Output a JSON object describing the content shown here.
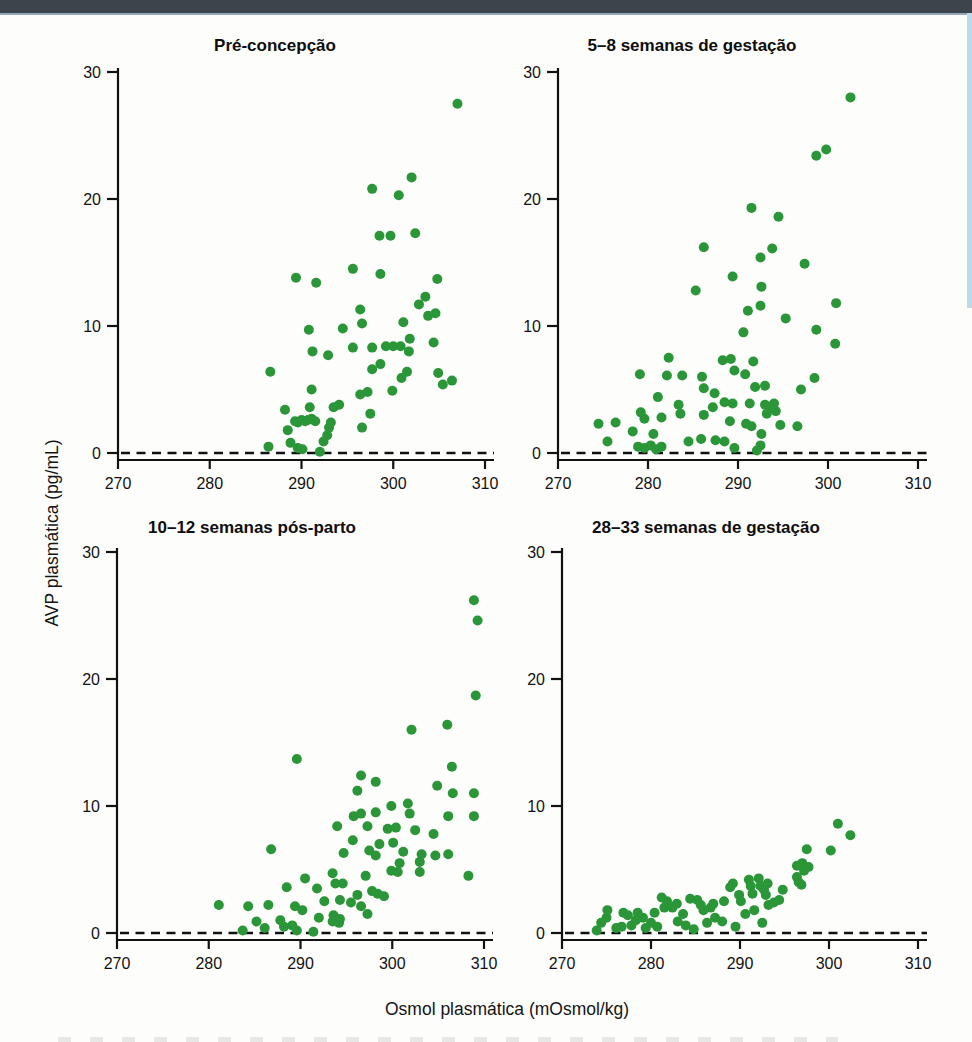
{
  "page": {
    "top_bar_color": "#3b454b",
    "right_edge_strip_color": "#badbe9",
    "background_color": "#fdfdfc"
  },
  "figure": {
    "y_axis_label": "AVP plasmática (pg/mL)",
    "x_axis_label": "Osmol plasmática (mOsmol/kg)",
    "dot_color": "#2a9638",
    "axis_color": "#121212",
    "zero_line_style": "dashed"
  },
  "chart_data": [
    {
      "type": "scatter",
      "title": "Pré-concepção",
      "xlabel": "Osmol plasmática (mOsmol/kg)",
      "ylabel": "AVP plasmática (pg/mL)",
      "xlim": [
        270,
        310
      ],
      "ylim": [
        0,
        30
      ],
      "xticks": [
        270,
        280,
        290,
        300,
        310
      ],
      "yticks": [
        0,
        10,
        20,
        30
      ],
      "grid": false,
      "dashed_zero_line": true,
      "points": [
        [
          307,
          27.5
        ],
        [
          302,
          21.7
        ],
        [
          297.7,
          20.8
        ],
        [
          300.6,
          20.3
        ],
        [
          298.5,
          17.1
        ],
        [
          299.7,
          17.1
        ],
        [
          302.4,
          17.3
        ],
        [
          295.6,
          14.5
        ],
        [
          298.6,
          14.1
        ],
        [
          304.8,
          13.7
        ],
        [
          289.4,
          13.8
        ],
        [
          291.6,
          13.4
        ],
        [
          303.5,
          12.3
        ],
        [
          302.8,
          11.7
        ],
        [
          296.4,
          11.3
        ],
        [
          304.6,
          11.0
        ],
        [
          303.8,
          10.8
        ],
        [
          296.6,
          10.2
        ],
        [
          301.1,
          10.3
        ],
        [
          290.8,
          9.7
        ],
        [
          294.5,
          9.8
        ],
        [
          301.8,
          9.0
        ],
        [
          291.2,
          8.0
        ],
        [
          292.9,
          7.7
        ],
        [
          295.6,
          8.3
        ],
        [
          297.7,
          8.3
        ],
        [
          299.2,
          8.4
        ],
        [
          300.0,
          8.4
        ],
        [
          300.8,
          8.4
        ],
        [
          301.7,
          8.0
        ],
        [
          304.4,
          8.7
        ],
        [
          286.6,
          6.4
        ],
        [
          297.7,
          6.6
        ],
        [
          298.6,
          7.0
        ],
        [
          300.9,
          5.9
        ],
        [
          301.5,
          6.4
        ],
        [
          304.9,
          6.3
        ],
        [
          305.4,
          5.4
        ],
        [
          306.4,
          5.7
        ],
        [
          291.1,
          5.0
        ],
        [
          296.4,
          4.6
        ],
        [
          297.2,
          4.8
        ],
        [
          299.9,
          4.9
        ],
        [
          288.2,
          3.4
        ],
        [
          290.9,
          3.6
        ],
        [
          293.5,
          3.6
        ],
        [
          294.1,
          3.8
        ],
        [
          297.5,
          3.1
        ],
        [
          289.3,
          2.5
        ],
        [
          289.6,
          2.4
        ],
        [
          290.0,
          2.6
        ],
        [
          290.4,
          2.5
        ],
        [
          290.7,
          2.6
        ],
        [
          291.1,
          2.7
        ],
        [
          291.5,
          2.5
        ],
        [
          293.2,
          2.4
        ],
        [
          296.6,
          2.0
        ],
        [
          288.5,
          1.8
        ],
        [
          292.8,
          1.4
        ],
        [
          293.0,
          2.0
        ],
        [
          286.4,
          0.5
        ],
        [
          288.8,
          0.8
        ],
        [
          289.6,
          0.4
        ],
        [
          290.1,
          0.3
        ],
        [
          292.0,
          0.1
        ],
        [
          292.4,
          0.9
        ]
      ]
    },
    {
      "type": "scatter",
      "title": "5–8 semanas de gestação",
      "xlabel": "Osmol plasmática (mOsmol/kg)",
      "ylabel": "AVP plasmática (pg/mL)",
      "xlim": [
        270,
        310
      ],
      "ylim": [
        0,
        30
      ],
      "xticks": [
        270,
        280,
        290,
        300,
        310
      ],
      "yticks": [
        0,
        10,
        20,
        30
      ],
      "grid": false,
      "dashed_zero_line": true,
      "points": [
        [
          302.5,
          28.0
        ],
        [
          299.8,
          23.9
        ],
        [
          298.7,
          23.4
        ],
        [
          291.5,
          19.3
        ],
        [
          294.5,
          18.6
        ],
        [
          286.2,
          16.2
        ],
        [
          293.8,
          16.1
        ],
        [
          292.5,
          15.4
        ],
        [
          297.4,
          14.9
        ],
        [
          289.4,
          13.9
        ],
        [
          292.6,
          13.1
        ],
        [
          285.3,
          12.8
        ],
        [
          292.5,
          11.6
        ],
        [
          300.9,
          11.8
        ],
        [
          291.1,
          11.2
        ],
        [
          295.3,
          10.6
        ],
        [
          298.7,
          9.7
        ],
        [
          290.6,
          9.5
        ],
        [
          300.8,
          8.6
        ],
        [
          282.3,
          7.5
        ],
        [
          288.3,
          7.3
        ],
        [
          289.2,
          7.4
        ],
        [
          291.7,
          7.2
        ],
        [
          279.1,
          6.2
        ],
        [
          282.1,
          6.1
        ],
        [
          283.8,
          6.1
        ],
        [
          286.0,
          6.0
        ],
        [
          289.6,
          6.5
        ],
        [
          290.8,
          6.2
        ],
        [
          298.5,
          5.9
        ],
        [
          286.2,
          5.1
        ],
        [
          291.9,
          5.2
        ],
        [
          293.0,
          5.3
        ],
        [
          297.0,
          5.0
        ],
        [
          281.1,
          4.4
        ],
        [
          287.4,
          4.7
        ],
        [
          283.4,
          3.8
        ],
        [
          287.2,
          3.6
        ],
        [
          288.5,
          4.0
        ],
        [
          289.4,
          3.9
        ],
        [
          291.3,
          3.9
        ],
        [
          293.0,
          3.8
        ],
        [
          293.6,
          3.6
        ],
        [
          294.0,
          3.9
        ],
        [
          279.2,
          3.2
        ],
        [
          283.6,
          3.1
        ],
        [
          286.2,
          3.0
        ],
        [
          293.2,
          3.1
        ],
        [
          294.2,
          3.3
        ],
        [
          274.5,
          2.3
        ],
        [
          276.4,
          2.4
        ],
        [
          279.6,
          2.7
        ],
        [
          281.5,
          2.8
        ],
        [
          289.1,
          2.5
        ],
        [
          290.9,
          2.3
        ],
        [
          291.5,
          2.1
        ],
        [
          294.7,
          2.2
        ],
        [
          296.6,
          2.1
        ],
        [
          278.3,
          1.7
        ],
        [
          280.6,
          1.5
        ],
        [
          292.6,
          1.5
        ],
        [
          275.5,
          0.9
        ],
        [
          284.5,
          0.9
        ],
        [
          285.9,
          1.1
        ],
        [
          287.5,
          1.0
        ],
        [
          288.5,
          0.9
        ],
        [
          278.9,
          0.5
        ],
        [
          279.6,
          0.4
        ],
        [
          280.3,
          0.6
        ],
        [
          280.9,
          0.3
        ],
        [
          281.5,
          0.5
        ],
        [
          289.6,
          0.4
        ],
        [
          292.1,
          0.2
        ],
        [
          292.5,
          0.6
        ]
      ]
    },
    {
      "type": "scatter",
      "title": "10–12 semanas pós-parto",
      "xlabel": "Osmol plasmática (mOsmol/kg)",
      "ylabel": "AVP plasmática (pg/mL)",
      "xlim": [
        270,
        310
      ],
      "ylim": [
        0,
        30
      ],
      "xticks": [
        270,
        280,
        290,
        300,
        310
      ],
      "yticks": [
        0,
        10,
        20,
        30
      ],
      "grid": false,
      "dashed_zero_line": true,
      "points": [
        [
          308.9,
          26.2
        ],
        [
          309.3,
          24.6
        ],
        [
          309.1,
          18.7
        ],
        [
          306.0,
          16.4
        ],
        [
          302.1,
          16.0
        ],
        [
          289.6,
          13.7
        ],
        [
          306.5,
          13.1
        ],
        [
          296.6,
          12.4
        ],
        [
          298.2,
          11.9
        ],
        [
          296.2,
          11.2
        ],
        [
          304.9,
          11.6
        ],
        [
          306.6,
          11.0
        ],
        [
          308.9,
          11.0
        ],
        [
          299.9,
          10.0
        ],
        [
          301.7,
          10.2
        ],
        [
          301.9,
          9.4
        ],
        [
          295.8,
          9.2
        ],
        [
          296.6,
          9.4
        ],
        [
          298.2,
          9.5
        ],
        [
          306.1,
          9.2
        ],
        [
          308.9,
          9.2
        ],
        [
          294.0,
          8.4
        ],
        [
          297.3,
          8.4
        ],
        [
          299.5,
          8.2
        ],
        [
          300.4,
          8.3
        ],
        [
          302.5,
          8.1
        ],
        [
          304.5,
          7.8
        ],
        [
          295.7,
          7.3
        ],
        [
          298.6,
          7.0
        ],
        [
          300.1,
          7.1
        ],
        [
          286.8,
          6.6
        ],
        [
          294.7,
          6.3
        ],
        [
          297.5,
          6.5
        ],
        [
          298.2,
          6.1
        ],
        [
          301.2,
          6.4
        ],
        [
          303.2,
          6.2
        ],
        [
          304.7,
          6.1
        ],
        [
          306.1,
          6.2
        ],
        [
          300.8,
          5.5
        ],
        [
          303.0,
          5.6
        ],
        [
          299.9,
          4.9
        ],
        [
          303.0,
          4.8
        ],
        [
          308.3,
          4.5
        ],
        [
          290.5,
          4.3
        ],
        [
          293.5,
          4.7
        ],
        [
          297.1,
          4.5
        ],
        [
          300.6,
          4.8
        ],
        [
          291.8,
          3.5
        ],
        [
          293.8,
          3.9
        ],
        [
          294.6,
          3.9
        ],
        [
          296.2,
          3.0
        ],
        [
          297.8,
          3.3
        ],
        [
          298.4,
          3.1
        ],
        [
          299.1,
          2.9
        ],
        [
          288.5,
          3.6
        ],
        [
          289.4,
          2.1
        ],
        [
          292.6,
          2.5
        ],
        [
          294.3,
          2.6
        ],
        [
          295.5,
          2.4
        ],
        [
          296.6,
          2.1
        ],
        [
          281.1,
          2.2
        ],
        [
          284.3,
          2.1
        ],
        [
          286.5,
          2.2
        ],
        [
          290.2,
          1.8
        ],
        [
          293.6,
          1.4
        ],
        [
          294.3,
          1.1
        ],
        [
          297.3,
          1.5
        ],
        [
          285.2,
          0.9
        ],
        [
          287.8,
          1.0
        ],
        [
          288.2,
          0.5
        ],
        [
          289.1,
          0.6
        ],
        [
          292.0,
          1.2
        ],
        [
          293.5,
          0.9
        ],
        [
          294.2,
          0.8
        ],
        [
          283.7,
          0.2
        ],
        [
          286.1,
          0.4
        ],
        [
          289.6,
          0.2
        ],
        [
          291.4,
          0.1
        ]
      ]
    },
    {
      "type": "scatter",
      "title": "28–33 semanas de gestação",
      "xlabel": "Osmol plasmática (mOsmol/kg)",
      "ylabel": "AVP plasmática (pg/mL)",
      "xlim": [
        270,
        310
      ],
      "ylim": [
        0,
        30
      ],
      "xticks": [
        270,
        280,
        290,
        300,
        310
      ],
      "yticks": [
        0,
        10,
        20,
        30
      ],
      "grid": false,
      "dashed_zero_line": true,
      "points": [
        [
          301.0,
          8.6
        ],
        [
          302.4,
          7.7
        ],
        [
          297.5,
          6.6
        ],
        [
          300.2,
          6.5
        ],
        [
          296.4,
          5.3
        ],
        [
          297.0,
          5.5
        ],
        [
          297.2,
          4.9
        ],
        [
          297.7,
          5.2
        ],
        [
          296.6,
          4.0
        ],
        [
          294.8,
          3.4
        ],
        [
          296.4,
          4.4
        ],
        [
          296.9,
          3.8
        ],
        [
          291.0,
          4.2
        ],
        [
          291.2,
          3.7
        ],
        [
          291.4,
          3.1
        ],
        [
          292.1,
          4.3
        ],
        [
          292.3,
          3.7
        ],
        [
          292.7,
          3.4
        ],
        [
          292.9,
          3.0
        ],
        [
          293.1,
          3.9
        ],
        [
          293.2,
          2.2
        ],
        [
          288.9,
          3.6
        ],
        [
          289.2,
          3.9
        ],
        [
          289.9,
          3.0
        ],
        [
          290.1,
          2.5
        ],
        [
          288.2,
          2.5
        ],
        [
          287.0,
          2.3
        ],
        [
          286.7,
          2.0
        ],
        [
          285.9,
          1.8
        ],
        [
          285.2,
          2.6
        ],
        [
          285.6,
          2.2
        ],
        [
          284.4,
          2.7
        ],
        [
          283.6,
          1.5
        ],
        [
          282.9,
          2.3
        ],
        [
          282.4,
          2.0
        ],
        [
          281.8,
          2.5
        ],
        [
          281.2,
          2.8
        ],
        [
          281.5,
          2.0
        ],
        [
          280.0,
          0.8
        ],
        [
          280.4,
          1.6
        ],
        [
          280.7,
          0.5
        ],
        [
          279.4,
          0.4
        ],
        [
          279.1,
          1.2
        ],
        [
          278.5,
          1.6
        ],
        [
          278.3,
          1.0
        ],
        [
          277.8,
          0.6
        ],
        [
          277.4,
          1.4
        ],
        [
          276.9,
          1.6
        ],
        [
          276.7,
          0.5
        ],
        [
          276.1,
          0.4
        ],
        [
          275.0,
          1.2
        ],
        [
          274.4,
          0.8
        ],
        [
          273.9,
          0.2
        ],
        [
          275.1,
          1.8
        ],
        [
          283.0,
          0.9
        ],
        [
          283.9,
          0.6
        ],
        [
          284.8,
          0.3
        ],
        [
          286.3,
          0.8
        ],
        [
          287.2,
          1.2
        ],
        [
          288.0,
          0.9
        ],
        [
          289.5,
          0.5
        ],
        [
          290.6,
          1.5
        ],
        [
          291.6,
          1.8
        ],
        [
          292.5,
          0.8
        ],
        [
          293.8,
          2.4
        ],
        [
          294.4,
          2.6
        ]
      ]
    }
  ]
}
